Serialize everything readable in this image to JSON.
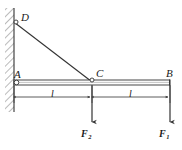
{
  "figure": {
    "type": "engineering-statics-diagram",
    "width": 182,
    "height": 150,
    "background_color": "#ffffff",
    "line_color": "#333333",
    "text_color": "#1a1a1a"
  },
  "points": {
    "a": {
      "label": "A",
      "x": 14,
      "y": 82,
      "note": "pin support at wall"
    },
    "b": {
      "label": "B",
      "x": 170,
      "y": 82,
      "note": "free end of beam"
    },
    "c": {
      "label": "C",
      "x": 92,
      "y": 82,
      "note": "tie rod connection on beam"
    },
    "d": {
      "label": "D",
      "x": 14,
      "y": 22,
      "note": "tie rod anchor on wall"
    }
  },
  "members": {
    "beam": {
      "name": "beam-AB",
      "from": "A",
      "to": "B"
    },
    "tie_rod": {
      "name": "tie-rod-DC",
      "from": "D",
      "to": "C"
    }
  },
  "wall": {
    "name": "fixed-wall",
    "x": 14,
    "top": 8,
    "bottom": 112,
    "hatch_side": "left"
  },
  "dimensions": [
    {
      "label": "l",
      "from": "A",
      "to": "C",
      "x1": 14,
      "x2": 92,
      "y": 97
    },
    {
      "label": "l",
      "from": "C",
      "to": "B",
      "x1": 92,
      "x2": 170,
      "y": 97
    }
  ],
  "forces": [
    {
      "label": "F",
      "subscript": "2",
      "at": "C",
      "x": 92,
      "direction": "down",
      "tail_y": 84,
      "head_y": 124
    },
    {
      "label": "F",
      "subscript": "1",
      "at": "B",
      "x": 170,
      "direction": "down",
      "tail_y": 84,
      "head_y": 124
    }
  ]
}
